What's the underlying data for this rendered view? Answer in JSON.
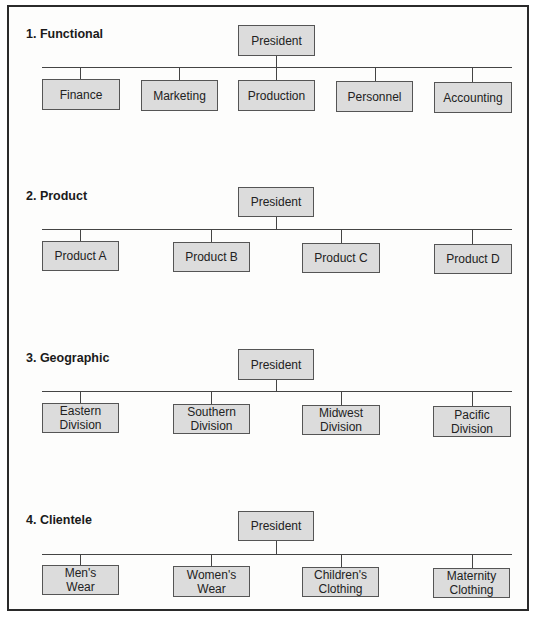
{
  "sections": [
    {
      "title": "1. Functional",
      "root": "President",
      "children": [
        "Finance",
        "Marketing",
        "Production",
        "Personnel",
        "Accounting"
      ]
    },
    {
      "title": "2. Product",
      "root": "President",
      "children": [
        "Product A",
        "Product B",
        "Product C",
        "Product D"
      ]
    },
    {
      "title": "3. Geographic",
      "root": "President",
      "children": [
        "Eastern\nDivision",
        "Southern\nDivision",
        "Midwest\nDivision",
        "Pacific\nDivision"
      ]
    },
    {
      "title": "4. Clientele",
      "root": "President",
      "children": [
        "Men's\nWear",
        "Women's\nWear",
        "Children's\nClothing",
        "Maternity\nClothing"
      ]
    }
  ],
  "colors": {
    "box_fill": "#dcdcdc",
    "box_border": "#555555",
    "line": "#444444",
    "frame": "#2a2a2a"
  }
}
